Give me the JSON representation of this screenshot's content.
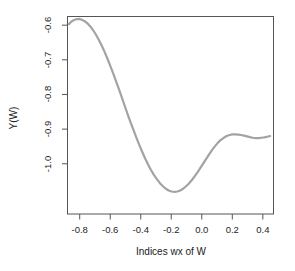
{
  "chart_data": {
    "type": "line",
    "title": "",
    "xlabel": "Indices wx of W",
    "ylabel": "Y(W)",
    "xlim": [
      -0.88,
      0.47
    ],
    "ylim": [
      -1.145,
      -0.575
    ],
    "xticks": [
      -0.8,
      -0.6,
      -0.4,
      -0.2,
      0.0,
      0.2,
      0.4
    ],
    "xtick_labels": [
      "-0.8",
      "-0.6",
      "-0.4",
      "-0.2",
      "0.0",
      "0.2",
      "0.4"
    ],
    "yticks": [
      -0.6,
      -0.7,
      -0.8,
      -0.9,
      -1.0
    ],
    "ytick_labels": [
      "-0.6",
      "-0.7",
      "-0.8",
      "-0.9",
      "-1.0"
    ],
    "grid": false,
    "legend": null,
    "line_color": "#a3a3a3",
    "line_width": 2.2,
    "axis_color": "#555555",
    "series": [
      {
        "name": "Y(W)",
        "x": [
          -0.871,
          -0.856,
          -0.84,
          -0.823,
          -0.805,
          -0.788,
          -0.77,
          -0.751,
          -0.732,
          -0.713,
          -0.694,
          -0.675,
          -0.656,
          -0.637,
          -0.618,
          -0.599,
          -0.58,
          -0.561,
          -0.542,
          -0.523,
          -0.504,
          -0.485,
          -0.466,
          -0.447,
          -0.428,
          -0.409,
          -0.39,
          -0.371,
          -0.352,
          -0.333,
          -0.314,
          -0.293,
          -0.274,
          -0.255,
          -0.236,
          -0.217,
          -0.198,
          -0.179,
          -0.16,
          -0.141,
          -0.122,
          -0.103,
          -0.084,
          -0.065,
          -0.046,
          -0.027,
          -0.008,
          0.011,
          0.03,
          0.049,
          0.068,
          0.087,
          0.106,
          0.125,
          0.144,
          0.163,
          0.182,
          0.201,
          0.22,
          0.239,
          0.258,
          0.277,
          0.296,
          0.315,
          0.334,
          0.353,
          0.372,
          0.391,
          0.41,
          0.429,
          0.448
        ],
        "y": [
          -0.597,
          -0.59,
          -0.586,
          -0.583,
          -0.582,
          -0.584,
          -0.588,
          -0.594,
          -0.603,
          -0.614,
          -0.627,
          -0.642,
          -0.659,
          -0.677,
          -0.697,
          -0.718,
          -0.74,
          -0.763,
          -0.786,
          -0.81,
          -0.834,
          -0.858,
          -0.881,
          -0.903,
          -0.925,
          -0.946,
          -0.966,
          -0.985,
          -1.002,
          -1.018,
          -1.032,
          -1.045,
          -1.056,
          -1.065,
          -1.072,
          -1.077,
          -1.08,
          -1.081,
          -1.08,
          -1.077,
          -1.072,
          -1.065,
          -1.057,
          -1.047,
          -1.036,
          -1.024,
          -1.011,
          -0.998,
          -0.985,
          -0.972,
          -0.96,
          -0.949,
          -0.939,
          -0.931,
          -0.925,
          -0.92,
          -0.917,
          -0.915,
          -0.915,
          -0.916,
          -0.917,
          -0.919,
          -0.921,
          -0.923,
          -0.925,
          -0.926,
          -0.926,
          -0.925,
          -0.924,
          -0.922,
          -0.92
        ],
        "annotations": [
          {
            "label": "local maximum (left peak)",
            "x": -0.805,
            "y": -0.582
          },
          {
            "label": "global minimum",
            "x": -0.179,
            "y": -1.081
          },
          {
            "label": "local maximum (right hump)",
            "x": 0.201,
            "y": -0.915
          }
        ]
      }
    ]
  }
}
